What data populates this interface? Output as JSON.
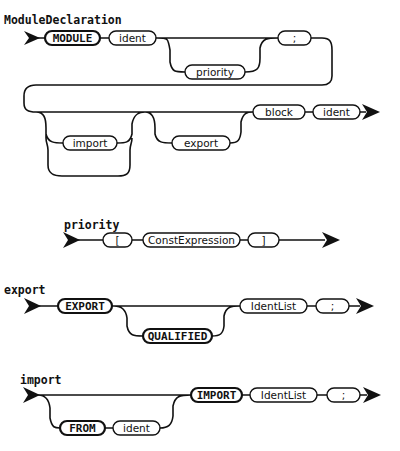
{
  "diagrams": [
    {
      "title": "ModuleDeclaration",
      "nodes": [
        {
          "label": "MODULE",
          "terminal": true
        },
        {
          "label": "ident",
          "terminal": false
        },
        {
          "label": "priority",
          "terminal": false,
          "optional": true
        },
        {
          "label": ";",
          "terminal": false
        },
        {
          "label": "import",
          "terminal": false,
          "repeatable": true
        },
        {
          "label": "export",
          "terminal": false,
          "optional": true
        },
        {
          "label": "block",
          "terminal": false
        },
        {
          "label": "ident",
          "terminal": false
        }
      ]
    },
    {
      "title": "priority",
      "nodes": [
        {
          "label": "[",
          "terminal": false
        },
        {
          "label": "ConstExpression",
          "terminal": false
        },
        {
          "label": "]",
          "terminal": false
        }
      ]
    },
    {
      "title": "export",
      "nodes": [
        {
          "label": "EXPORT",
          "terminal": true
        },
        {
          "label": "QUALIFIED",
          "terminal": true,
          "optional": true
        },
        {
          "label": "IdentList",
          "terminal": false
        },
        {
          "label": ";",
          "terminal": false
        }
      ]
    },
    {
      "title": "import",
      "nodes": [
        {
          "label": "FROM",
          "terminal": true,
          "optional": true
        },
        {
          "label": "ident",
          "terminal": false,
          "optional": true
        },
        {
          "label": "IMPORT",
          "terminal": true
        },
        {
          "label": "IdentList",
          "terminal": false
        },
        {
          "label": ";",
          "terminal": false
        }
      ]
    }
  ]
}
